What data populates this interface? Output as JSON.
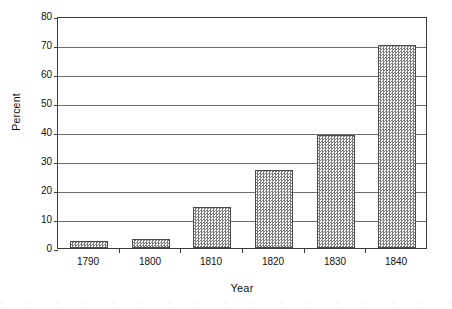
{
  "chart_data": {
    "type": "bar",
    "title": "",
    "subtitle": "",
    "xlabel": "Year",
    "ylabel": "Percent",
    "categories": [
      "1790",
      "1800",
      "1810",
      "1820",
      "1830",
      "1840"
    ],
    "values": [
      2.5,
      3,
      14,
      27,
      39,
      70
    ],
    "series": [
      {
        "name": "Percent",
        "values": [
          2.5,
          3,
          14,
          27,
          39,
          70
        ]
      }
    ],
    "ylim": [
      0,
      80
    ],
    "ytick_labels": [
      "0",
      "10",
      "20",
      "30",
      "40",
      "50",
      "60",
      "70",
      "80"
    ],
    "ytick_values": [
      0,
      10,
      20,
      30,
      40,
      50,
      60,
      70,
      80
    ],
    "grid": "horizontal",
    "legend": "none",
    "annotations": [],
    "bar_fill": "gray-checkered-hatch",
    "colors": {
      "bar_fill": "#7d7d7d",
      "bar_border": "#4a4a4a",
      "gridline": "#6e6e6e",
      "axis": "#3a3a3a",
      "text": "#111111",
      "background": "#ffffff"
    }
  }
}
